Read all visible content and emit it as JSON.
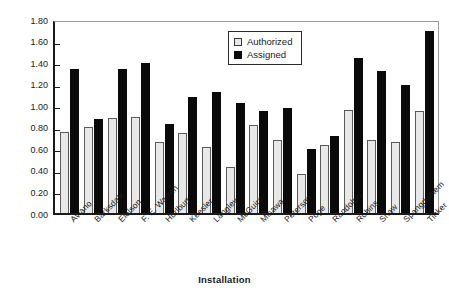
{
  "chart_data": {
    "type": "bar",
    "title": "",
    "xlabel": "Installation",
    "ylabel": "Training load",
    "ylim": [
      0.0,
      1.8
    ],
    "ytick_step": 0.2,
    "ytick_labels": [
      "1.80",
      "1.60",
      "1.40",
      "1.20",
      "1.00",
      "0.80",
      "0.60",
      "0.40",
      "0.20",
      "0.00"
    ],
    "ytick_values": [
      1.8,
      1.6,
      1.4,
      1.2,
      1.0,
      0.8,
      0.6,
      0.4,
      0.2,
      0.0
    ],
    "grid": false,
    "legend_position": "top-right-inside",
    "categories": [
      "Aviano",
      "Barksdale",
      "Eielson",
      "F. E. Warren",
      "Hurlburt",
      "Keesler",
      "Langley",
      "McGuire",
      "Misawa",
      "Peterson",
      "Pope",
      "Randolph",
      "Robins",
      "Shaw",
      "Spangdahlem",
      "Tinker"
    ],
    "series": [
      {
        "name": "Authorized",
        "color": "#e8e8e8",
        "values": [
          0.75,
          0.8,
          0.88,
          0.89,
          0.66,
          0.74,
          0.61,
          0.43,
          0.82,
          0.68,
          0.36,
          0.63,
          0.96,
          0.68,
          0.66,
          0.95
        ]
      },
      {
        "name": "Assigned",
        "color": "#0a0a0a",
        "values": [
          1.34,
          0.87,
          1.34,
          1.39,
          0.83,
          1.08,
          1.12,
          1.02,
          0.95,
          0.97,
          0.59,
          0.71,
          1.44,
          1.32,
          1.19,
          1.69
        ]
      }
    ]
  },
  "legend": {
    "items": [
      {
        "label": "Authorized",
        "swatch": "authorized"
      },
      {
        "label": "Assigned",
        "swatch": "assigned"
      }
    ]
  }
}
